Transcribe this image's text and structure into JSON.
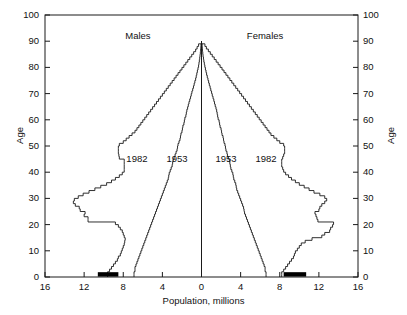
{
  "chart_data": {
    "type": "line",
    "title": "",
    "xlabel": "Population, millions",
    "ylabel": "Age",
    "ylabel_right": "Age",
    "xlim": [
      -16,
      16
    ],
    "ylim": [
      0,
      100
    ],
    "grid": false,
    "legend_position": "inline-annotations",
    "x_ticks": [
      "16",
      "12",
      "8",
      "4",
      "0",
      "4",
      "8",
      "12",
      "16"
    ],
    "x_tick_values": [
      -16,
      -12,
      -8,
      -4,
      0,
      4,
      8,
      12,
      16
    ],
    "y_ticks": [
      "0",
      "10",
      "20",
      "30",
      "40",
      "50",
      "60",
      "70",
      "80",
      "90",
      "100"
    ],
    "y_tick_values": [
      0,
      10,
      20,
      30,
      40,
      50,
      60,
      70,
      80,
      90,
      100
    ],
    "annotations": [
      {
        "text": "Males",
        "x": -6.5,
        "y": 92,
        "name": "males-label"
      },
      {
        "text": "Females",
        "x": 6.5,
        "y": 92,
        "name": "females-label"
      },
      {
        "text": "1982",
        "x": -6.6,
        "y": 45,
        "name": "males-1982-label"
      },
      {
        "text": "1953",
        "x": -2.5,
        "y": 45,
        "name": "males-1953-label"
      },
      {
        "text": "1953",
        "x": 2.5,
        "y": 45,
        "name": "females-1953-label"
      },
      {
        "text": "1982",
        "x": 6.6,
        "y": 45,
        "name": "females-1982-label"
      }
    ],
    "series": [
      {
        "name": "Males 1953",
        "side": "left",
        "year": 1953,
        "sex": "Males",
        "ages": [
          0,
          1,
          2,
          3,
          4,
          5,
          6,
          7,
          8,
          9,
          10,
          11,
          12,
          13,
          14,
          15,
          16,
          17,
          18,
          19,
          20,
          21,
          22,
          23,
          24,
          25,
          26,
          27,
          28,
          29,
          30,
          31,
          32,
          33,
          34,
          35,
          36,
          37,
          38,
          39,
          40,
          41,
          42,
          43,
          44,
          45,
          46,
          47,
          48,
          49,
          50,
          51,
          52,
          53,
          54,
          55,
          56,
          57,
          58,
          59,
          60,
          61,
          62,
          63,
          64,
          65,
          66,
          67,
          68,
          69,
          70,
          71,
          72,
          73,
          74,
          75,
          76,
          77,
          78,
          79,
          80,
          81,
          82,
          83,
          84,
          85,
          86,
          87,
          88,
          89
        ],
        "population": [
          6.9,
          6.9,
          6.8,
          6.8,
          6.7,
          6.6,
          6.5,
          6.4,
          6.3,
          6.2,
          6.1,
          6.0,
          5.9,
          5.8,
          5.7,
          5.6,
          5.5,
          5.4,
          5.3,
          5.2,
          5.1,
          5.0,
          4.9,
          4.8,
          4.7,
          4.6,
          4.5,
          4.4,
          4.3,
          4.2,
          4.1,
          4.0,
          3.9,
          3.8,
          3.7,
          3.6,
          3.5,
          3.4,
          3.35,
          3.3,
          3.2,
          3.1,
          3.0,
          2.95,
          2.9,
          2.8,
          2.7,
          2.6,
          2.5,
          2.45,
          2.4,
          2.3,
          2.2,
          2.15,
          2.1,
          2.0,
          1.95,
          1.9,
          1.8,
          1.75,
          1.7,
          1.6,
          1.55,
          1.5,
          1.42,
          1.35,
          1.28,
          1.2,
          1.12,
          1.05,
          0.98,
          0.9,
          0.82,
          0.75,
          0.68,
          0.6,
          0.54,
          0.48,
          0.42,
          0.36,
          0.3,
          0.26,
          0.22,
          0.18,
          0.15,
          0.12,
          0.09,
          0.07,
          0.05,
          0.0
        ]
      },
      {
        "name": "Males 1982",
        "side": "left",
        "year": 1982,
        "sex": "Males",
        "ages": [
          0,
          1,
          2,
          3,
          4,
          5,
          6,
          7,
          8,
          9,
          10,
          11,
          12,
          13,
          14,
          15,
          16,
          17,
          18,
          19,
          20,
          21,
          22,
          23,
          24,
          25,
          26,
          27,
          28,
          29,
          30,
          31,
          32,
          33,
          34,
          35,
          36,
          37,
          38,
          39,
          40,
          41,
          42,
          43,
          44,
          45,
          46,
          47,
          48,
          49,
          50,
          51,
          52,
          53,
          54,
          55,
          56,
          57,
          58,
          59,
          60,
          61,
          62,
          63,
          64,
          65,
          66,
          67,
          68,
          69,
          70,
          71,
          72,
          73,
          74,
          75,
          76,
          77,
          78,
          79,
          80,
          81,
          82,
          83,
          84,
          85,
          86,
          87,
          88,
          89
        ],
        "population": [
          9.6,
          9.6,
          9.4,
          9.2,
          9.0,
          8.8,
          8.6,
          8.5,
          8.3,
          8.2,
          8.1,
          8.0,
          7.9,
          7.85,
          7.8,
          7.9,
          8.0,
          8.1,
          8.3,
          8.5,
          8.8,
          11.6,
          11.6,
          12.0,
          11.9,
          12.4,
          12.5,
          12.9,
          13.1,
          13.0,
          12.6,
          12.1,
          11.5,
          10.9,
          10.3,
          9.7,
          9.2,
          8.8,
          8.4,
          8.1,
          7.9,
          7.9,
          7.9,
          7.9,
          7.9,
          8.4,
          8.45,
          8.5,
          8.5,
          8.5,
          8.4,
          8.0,
          7.7,
          7.4,
          7.1,
          6.8,
          6.6,
          6.4,
          6.2,
          6.0,
          5.8,
          5.6,
          5.4,
          5.2,
          5.0,
          4.8,
          4.6,
          4.4,
          4.2,
          4.0,
          3.8,
          3.6,
          3.4,
          3.2,
          3.0,
          2.8,
          2.6,
          2.4,
          2.2,
          2.0,
          1.8,
          1.6,
          1.4,
          1.2,
          1.0,
          0.8,
          0.6,
          0.45,
          0.3,
          0.0
        ]
      },
      {
        "name": "Females 1953",
        "side": "right",
        "year": 1953,
        "sex": "Females",
        "ages": [
          0,
          1,
          2,
          3,
          4,
          5,
          6,
          7,
          8,
          9,
          10,
          11,
          12,
          13,
          14,
          15,
          16,
          17,
          18,
          19,
          20,
          21,
          22,
          23,
          24,
          25,
          26,
          27,
          28,
          29,
          30,
          31,
          32,
          33,
          34,
          35,
          36,
          37,
          38,
          39,
          40,
          41,
          42,
          43,
          44,
          45,
          46,
          47,
          48,
          49,
          50,
          51,
          52,
          53,
          54,
          55,
          56,
          57,
          58,
          59,
          60,
          61,
          62,
          63,
          64,
          65,
          66,
          67,
          68,
          69,
          70,
          71,
          72,
          73,
          74,
          75,
          76,
          77,
          78,
          79,
          80,
          81,
          82,
          83,
          84,
          85,
          86,
          87,
          88,
          89
        ],
        "population": [
          6.6,
          6.6,
          6.5,
          6.5,
          6.4,
          6.3,
          6.2,
          6.1,
          6.0,
          5.9,
          5.8,
          5.7,
          5.6,
          5.5,
          5.4,
          5.3,
          5.2,
          5.1,
          5.0,
          4.9,
          4.8,
          4.7,
          4.6,
          4.5,
          4.4,
          4.35,
          4.3,
          4.2,
          4.1,
          4.0,
          3.9,
          3.8,
          3.7,
          3.6,
          3.55,
          3.5,
          3.4,
          3.3,
          3.25,
          3.2,
          3.1,
          3.0,
          2.95,
          2.9,
          2.85,
          2.75,
          2.65,
          2.6,
          2.5,
          2.45,
          2.4,
          2.3,
          2.25,
          2.2,
          2.1,
          2.05,
          2.0,
          1.9,
          1.85,
          1.8,
          1.7,
          1.65,
          1.6,
          1.55,
          1.48,
          1.4,
          1.33,
          1.26,
          1.18,
          1.1,
          1.03,
          0.95,
          0.88,
          0.8,
          0.73,
          0.66,
          0.59,
          0.52,
          0.46,
          0.4,
          0.34,
          0.29,
          0.24,
          0.2,
          0.16,
          0.13,
          0.1,
          0.08,
          0.06,
          0.0
        ]
      },
      {
        "name": "Females 1982",
        "side": "right",
        "year": 1982,
        "sex": "Females",
        "ages": [
          0,
          1,
          2,
          3,
          4,
          5,
          6,
          7,
          8,
          9,
          10,
          11,
          12,
          13,
          14,
          15,
          16,
          17,
          18,
          19,
          20,
          21,
          22,
          23,
          24,
          25,
          26,
          27,
          28,
          29,
          30,
          31,
          32,
          33,
          34,
          35,
          36,
          37,
          38,
          39,
          40,
          41,
          42,
          43,
          44,
          45,
          46,
          47,
          48,
          49,
          50,
          51,
          52,
          53,
          54,
          55,
          56,
          57,
          58,
          59,
          60,
          61,
          62,
          63,
          64,
          65,
          66,
          67,
          68,
          69,
          70,
          71,
          72,
          73,
          74,
          75,
          76,
          77,
          78,
          79,
          80,
          81,
          82,
          83,
          84,
          85,
          86,
          87,
          88,
          89
        ],
        "population": [
          8.2,
          8.2,
          8.4,
          8.6,
          8.8,
          9.0,
          9.2,
          9.4,
          9.5,
          9.6,
          9.8,
          10.0,
          10.2,
          10.6,
          11.3,
          12.3,
          12.6,
          13.1,
          13.2,
          13.4,
          13.5,
          11.9,
          11.8,
          11.7,
          11.6,
          12.0,
          12.1,
          12.3,
          12.6,
          12.8,
          12.6,
          12.1,
          11.5,
          11.0,
          10.5,
          10.0,
          9.6,
          9.2,
          8.9,
          8.6,
          8.4,
          8.3,
          8.2,
          8.2,
          8.2,
          8.3,
          8.4,
          8.5,
          8.5,
          8.5,
          8.4,
          8.0,
          7.7,
          7.4,
          7.1,
          6.9,
          6.7,
          6.5,
          6.3,
          6.1,
          5.9,
          5.7,
          5.5,
          5.3,
          5.1,
          4.9,
          4.7,
          4.5,
          4.3,
          4.1,
          3.9,
          3.7,
          3.5,
          3.3,
          3.1,
          2.9,
          2.7,
          2.5,
          2.3,
          2.1,
          1.9,
          1.7,
          1.5,
          1.3,
          1.1,
          0.9,
          0.7,
          0.5,
          0.35,
          0.0
        ]
      }
    ],
    "highlight_bars": [
      {
        "name": "males-birth-cohort-bar",
        "side": "left",
        "x_start": -10.6,
        "x_end": -8.5,
        "y": 1,
        "color": "#000000"
      },
      {
        "name": "females-birth-cohort-bar",
        "side": "right",
        "x_start": 8.4,
        "x_end": 10.7,
        "y": 1,
        "color": "#000000"
      }
    ]
  },
  "colors": {
    "axis": "#1a1a1a",
    "curve": "#1a1a1a",
    "background": "#ffffff",
    "highlight": "#000000"
  }
}
